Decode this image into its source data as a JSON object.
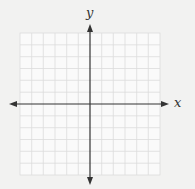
{
  "diagram": {
    "type": "coordinate-plane",
    "x_axis_label": "x",
    "y_axis_label": "y",
    "grid": {
      "columns": 12,
      "rows": 12
    },
    "colors": {
      "background": "#f2f2f1",
      "grid": "#d8d8d8",
      "axis": "#333333"
    }
  }
}
